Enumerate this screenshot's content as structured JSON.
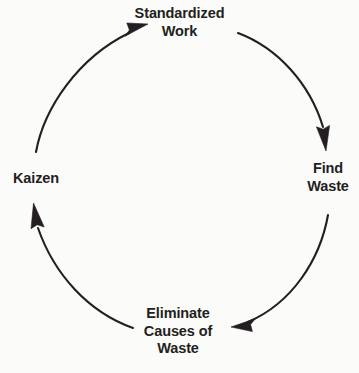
{
  "diagram": {
    "type": "cycle",
    "direction": "clockwise",
    "background_color": "#fbfbfa",
    "stroke_color": "#231f20",
    "text_color": "#231f20",
    "nodes": [
      {
        "id": "standardized-work",
        "position": "top",
        "lines": [
          "Standardized",
          "Work"
        ]
      },
      {
        "id": "find-waste",
        "position": "right",
        "lines": [
          "Find",
          "Waste"
        ]
      },
      {
        "id": "eliminate-causes-of-waste",
        "position": "bottom",
        "lines": [
          "Eliminate",
          "Causes of",
          "Waste"
        ]
      },
      {
        "id": "kaizen",
        "position": "left",
        "lines": [
          "Kaizen"
        ]
      }
    ],
    "arrows": [
      {
        "id": "arrow-standardized-to-find",
        "from": "standardized-work",
        "to": "find-waste"
      },
      {
        "id": "arrow-find-to-eliminate",
        "from": "find-waste",
        "to": "eliminate-causes-of-waste"
      },
      {
        "id": "arrow-eliminate-to-kaizen",
        "from": "eliminate-causes-of-waste",
        "to": "kaizen"
      },
      {
        "id": "arrow-kaizen-to-standardized",
        "from": "kaizen",
        "to": "standardized-work"
      }
    ]
  }
}
